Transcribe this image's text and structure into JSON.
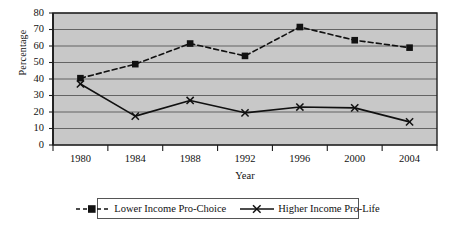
{
  "chart_data": {
    "type": "line",
    "title": "",
    "xlabel": "Year",
    "ylabel": "Percentage",
    "categories": [
      "1980",
      "1984",
      "1988",
      "1992",
      "1996",
      "2000",
      "2004"
    ],
    "x": [
      1980,
      1984,
      1988,
      1992,
      1996,
      2000,
      2004
    ],
    "ylim": [
      0,
      80
    ],
    "ytick_step": 10,
    "yticks": [
      "0",
      "10",
      "20",
      "30",
      "40",
      "50",
      "60",
      "70",
      "80"
    ],
    "grid": "horizontal",
    "legend_position": "bottom",
    "plot_background": "#c8c8c8",
    "series": [
      {
        "name": "Lower Income Pro-Choice",
        "values": [
          40.5,
          49,
          61.5,
          54,
          71.5,
          63.5,
          59
        ],
        "line_style": "dashed",
        "marker": "square",
        "color": "#111111"
      },
      {
        "name": "Higher Income Pro-Life",
        "values": [
          37,
          17.5,
          27,
          19.5,
          23,
          22.5,
          14
        ],
        "line_style": "solid",
        "marker": "x",
        "color": "#111111"
      }
    ]
  },
  "legend": {
    "entries": [
      {
        "label": "Lower Income Pro-Choice"
      },
      {
        "label": "Higher Income Pro-Life"
      }
    ]
  }
}
